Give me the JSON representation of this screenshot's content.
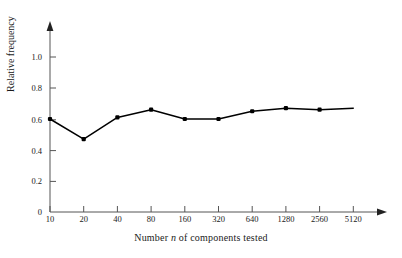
{
  "chart_data": {
    "type": "line",
    "title": "",
    "subtitle": "",
    "xlabel_parts": {
      "before": "Number ",
      "italic": "n",
      "after": " of components tested"
    },
    "xlabel": "Number n of components tested",
    "ylabel": "Relative frequency",
    "categories": [
      "10",
      "20",
      "40",
      "80",
      "160",
      "320",
      "640",
      "1280",
      "2560",
      "5120"
    ],
    "x": [
      10,
      20,
      40,
      80,
      160,
      320,
      640,
      1280,
      2560,
      5120
    ],
    "values": [
      0.6,
      0.47,
      0.61,
      0.66,
      0.6,
      0.6,
      0.65,
      0.67,
      0.66,
      0.67
    ],
    "xtick_labels": [
      "10",
      "20",
      "40",
      "80",
      "160",
      "320",
      "640",
      "1280",
      "2560",
      "5120"
    ],
    "ytick_labels": [
      "0",
      "0.2",
      "0.4",
      "0.6",
      "0.8",
      "1.0"
    ],
    "ytick_values": [
      0,
      0.2,
      0.4,
      0.6,
      0.8,
      1.0
    ],
    "ylim": [
      0,
      1.15
    ],
    "xlim_note": "log2 spaced categories, evenly spaced on axis",
    "grid": false,
    "legend": false,
    "legend_position": "none",
    "marker": "filled-square-dot",
    "line_color": "#000000",
    "marker_color": "#000000",
    "axis_color": "#555555",
    "background_color": "#ffffff",
    "annotations": []
  },
  "axes": {
    "x_axis_name": "x-axis",
    "y_axis_name": "y-axis",
    "x_arrow": true,
    "y_arrow": true
  }
}
